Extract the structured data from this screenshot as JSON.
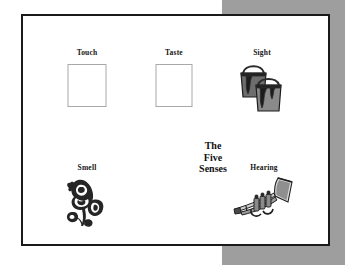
{
  "page": {
    "background_color": "#ffffff",
    "panel_color": "#9e9e9e",
    "card_border_color": "#1a1a1a",
    "box_border_color": "#a8a8a8"
  },
  "center_title": {
    "line1": "The",
    "line2": "Five",
    "line3": "Senses"
  },
  "senses": {
    "touch": {
      "label": "Touch",
      "art": "empty-box"
    },
    "taste": {
      "label": "Taste",
      "art": "empty-box"
    },
    "sight": {
      "label": "Sight",
      "art": "paint-cans-clipart"
    },
    "smell": {
      "label": "Smell",
      "art": "rose-clipart"
    },
    "hearing": {
      "label": "Hearing",
      "art": "trumpet-clipart"
    }
  }
}
